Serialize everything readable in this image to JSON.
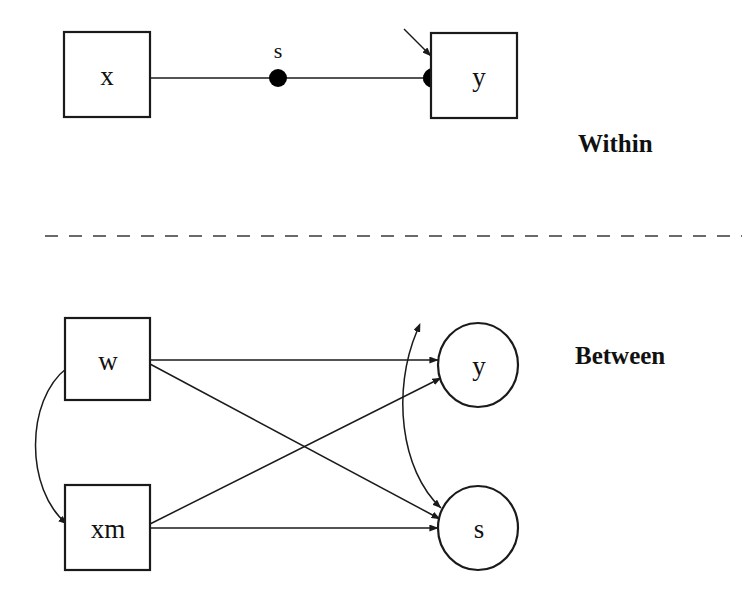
{
  "figure": {
    "type": "path-diagram",
    "background_color": "#ffffff",
    "line_color": "#1a1a1a",
    "divider_color": "#6a6a6a",
    "width": 751,
    "height": 596
  },
  "sections": {
    "within": {
      "label": "Within",
      "label_x": 578,
      "label_y": 152
    },
    "between": {
      "label": "Between",
      "label_x": 575,
      "label_y": 364
    }
  },
  "within": {
    "nodes": [
      {
        "id": "x",
        "label": "x",
        "shape": "rect",
        "x": 64,
        "y": 32,
        "w": 86,
        "h": 85
      },
      {
        "id": "y",
        "label": "y",
        "shape": "rect",
        "x": 431,
        "y": 33,
        "w": 86,
        "h": 85
      }
    ],
    "random_slope": {
      "label": "s",
      "dot_x": 278,
      "dot_y": 78,
      "label_x": 278,
      "label_y": 58
    },
    "endpoint_dot": {
      "x": 432,
      "y": 78
    },
    "edges": [
      {
        "from": "x",
        "to": "y",
        "kind": "directed",
        "label": ""
      },
      {
        "from": "residual",
        "to": "y",
        "kind": "directed-short",
        "label": ""
      }
    ]
  },
  "between": {
    "nodes": [
      {
        "id": "w",
        "label": "w",
        "shape": "rect",
        "x": 65,
        "y": 318,
        "w": 85,
        "h": 82
      },
      {
        "id": "xm",
        "label": "xm",
        "shape": "rect",
        "x": 65,
        "y": 485,
        "w": 85,
        "h": 85
      },
      {
        "id": "y",
        "label": "y",
        "shape": "ellipse",
        "cx": 478,
        "cy": 365,
        "rx": 40,
        "ry": 42
      },
      {
        "id": "s",
        "label": "s",
        "shape": "ellipse",
        "cx": 478,
        "cy": 528,
        "rx": 40,
        "ry": 42
      }
    ],
    "edges": [
      {
        "from": "w",
        "to": "y",
        "kind": "directed"
      },
      {
        "from": "w",
        "to": "s",
        "kind": "directed"
      },
      {
        "from": "xm",
        "to": "y",
        "kind": "directed"
      },
      {
        "from": "xm",
        "to": "s",
        "kind": "directed"
      },
      {
        "from": "w",
        "to": "xm",
        "kind": "bidirectional-curve"
      },
      {
        "from": "y",
        "to": "s",
        "kind": "bidirectional-curve"
      }
    ]
  },
  "divider": {
    "style": "dashed",
    "x1": 45,
    "x2": 742,
    "y": 236
  }
}
